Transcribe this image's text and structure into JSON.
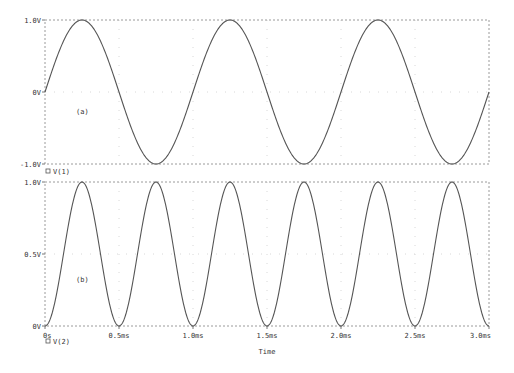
{
  "chart_data": [
    {
      "type": "line",
      "panel_label": "(a)",
      "xlabel": "",
      "ylabel": "",
      "xlim": [
        0,
        3.0
      ],
      "x_unit": "ms",
      "ylim": [
        -1.0,
        1.0
      ],
      "yticks": [
        1.0,
        0.0,
        -1.0
      ],
      "ytick_labels": [
        "1.0V",
        "0V",
        "-1.0V"
      ],
      "grid": true,
      "legend": "bottom-left",
      "series": [
        {
          "name": "V(1)",
          "function": "sin(2*pi*1kHz*t)",
          "amplitude": 1.0,
          "frequency_khz": 1.0,
          "x": [
            0,
            0.25,
            0.5,
            0.75,
            1.0,
            1.25,
            1.5,
            1.75,
            2.0,
            2.25,
            2.5,
            2.75,
            3.0
          ],
          "y": [
            0,
            1.0,
            0,
            -1.0,
            0,
            1.0,
            0,
            -1.0,
            0,
            1.0,
            0,
            -1.0,
            0
          ]
        }
      ]
    },
    {
      "type": "line",
      "panel_label": "(b)",
      "xlabel": "Time",
      "ylabel": "",
      "xlim": [
        0,
        3.0
      ],
      "x_unit": "ms",
      "xticks": [
        0,
        0.5,
        1.0,
        1.5,
        2.0,
        2.5,
        3.0
      ],
      "xtick_labels": [
        "0s",
        "0.5ms",
        "1.0ms",
        "1.5ms",
        "2.0ms",
        "2.5ms",
        "3.0ms"
      ],
      "ylim": [
        0,
        1.0
      ],
      "yticks": [
        1.0,
        0.5,
        0.0
      ],
      "ytick_labels": [
        "1.0V",
        "0.5V",
        "0V"
      ],
      "grid": true,
      "legend": "bottom-left",
      "series": [
        {
          "name": "V(2)",
          "function": "sin^2(2*pi*1kHz*t)",
          "amplitude": 1.0,
          "frequency_khz": 1.0,
          "x": [
            0,
            0.25,
            0.5,
            0.75,
            1.0,
            1.25,
            1.5,
            1.75,
            2.0,
            2.25,
            2.5,
            2.75,
            3.0
          ],
          "y": [
            0,
            1.0,
            0,
            1.0,
            0,
            1.0,
            0,
            1.0,
            0,
            1.0,
            0,
            1.0,
            0
          ]
        }
      ]
    }
  ]
}
